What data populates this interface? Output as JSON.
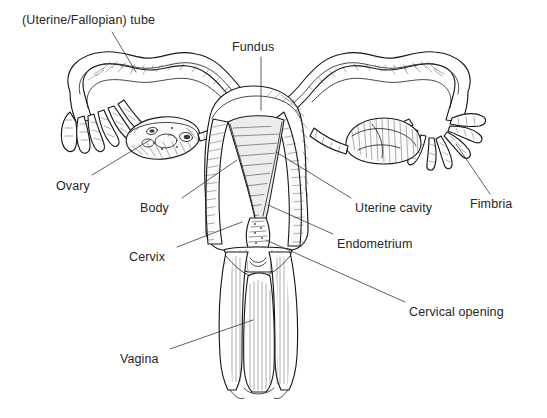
{
  "figure": {
    "background_color": "#ffffff",
    "ink_color": "#1a1a1a",
    "label_color": "#262626",
    "width": 547,
    "height": 418
  },
  "labels": [
    {
      "id": "uterine-fallopian-tube",
      "text": "(Uterine/Fallopian) tube",
      "x": 22,
      "y": 14,
      "leader_from": [
        112,
        32
      ],
      "leader_to": [
        136,
        72
      ]
    },
    {
      "id": "fundus",
      "text": "Fundus",
      "x": 232,
      "y": 41,
      "leader_from": [
        261,
        57
      ],
      "leader_to": [
        261,
        110
      ]
    },
    {
      "id": "ovary",
      "text": "Ovary",
      "x": 56,
      "y": 180,
      "leader_from": [
        92,
        175
      ],
      "leader_to": [
        150,
        140
      ]
    },
    {
      "id": "body",
      "text": "Body",
      "x": 140,
      "y": 202,
      "leader_from": [
        182,
        198
      ],
      "leader_to": [
        237,
        160
      ]
    },
    {
      "id": "cervix",
      "text": "Cervix",
      "x": 129,
      "y": 251,
      "leader_from": [
        177,
        247
      ],
      "leader_to": [
        242,
        222
      ]
    },
    {
      "id": "vagina",
      "text": "Vagina",
      "x": 120,
      "y": 353,
      "leader_from": [
        170,
        349
      ],
      "leader_to": [
        253,
        320
      ]
    },
    {
      "id": "uterine-cavity",
      "text": "Uterine cavity",
      "x": 355,
      "y": 202,
      "leader_from": [
        351,
        198
      ],
      "leader_to": [
        276,
        152
      ]
    },
    {
      "id": "endometrium",
      "text": "Endometrium",
      "x": 337,
      "y": 238,
      "leader_from": [
        333,
        234
      ],
      "leader_to": [
        268,
        205
      ]
    },
    {
      "id": "cervical-opening",
      "text": "Cervical opening",
      "x": 409,
      "y": 306,
      "leader_from": [
        405,
        302
      ],
      "leader_to": [
        266,
        240
      ]
    },
    {
      "id": "fimbria",
      "text": "Fimbria",
      "x": 470,
      "y": 198,
      "leader_from": [
        490,
        194
      ],
      "leader_to": [
        456,
        144
      ]
    }
  ]
}
